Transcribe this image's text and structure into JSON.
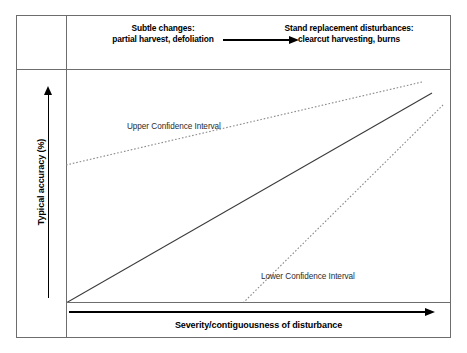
{
  "figure": {
    "header": {
      "left_label": "Subtle changes:\npartial harvest, defoliation",
      "left_label_line1": "Subtle changes:",
      "left_label_line2": "partial harvest, defoliation",
      "right_label_line1": "Stand replacement disturbances:",
      "right_label_line2": "clearcut harvesting, burns",
      "arrow": "right-arrow"
    },
    "y_axis": {
      "title": "Typical accuracy (%)",
      "arrow": "up-arrow"
    },
    "x_axis": {
      "title": "Severity/contiguousness of disturbance",
      "arrow": "right-arrow"
    },
    "annotations": {
      "upper_ci": "Upper Confidence Interval",
      "lower_ci": "Lower Confidence Interval"
    },
    "colors": {
      "frame": "#6d6d6d",
      "line": "#3a3a3a",
      "dotted": "#8a8a8a",
      "text": "#000000"
    }
  },
  "chart_data": {
    "type": "line",
    "title": "",
    "xlabel": "Severity/contiguousness of disturbance",
    "ylabel": "Typical accuracy (%)",
    "xlim": [
      0,
      385
    ],
    "ylim": [
      0,
      233
    ],
    "grid": false,
    "legend": "inline-annotations",
    "axis_ticks": {
      "x": [],
      "y": []
    },
    "series": [
      {
        "name": "Typical accuracy (trend)",
        "style": "solid",
        "points": [
          [
            0,
            233
          ],
          [
            366,
            23
          ]
        ]
      },
      {
        "name": "Upper Confidence Interval",
        "style": "dotted",
        "points": [
          [
            0,
            95
          ],
          [
            356,
            12
          ]
        ]
      },
      {
        "name": "Lower Confidence Interval",
        "style": "dotted",
        "points": [
          [
            177,
            233
          ],
          [
            377,
            35
          ]
        ]
      }
    ]
  }
}
